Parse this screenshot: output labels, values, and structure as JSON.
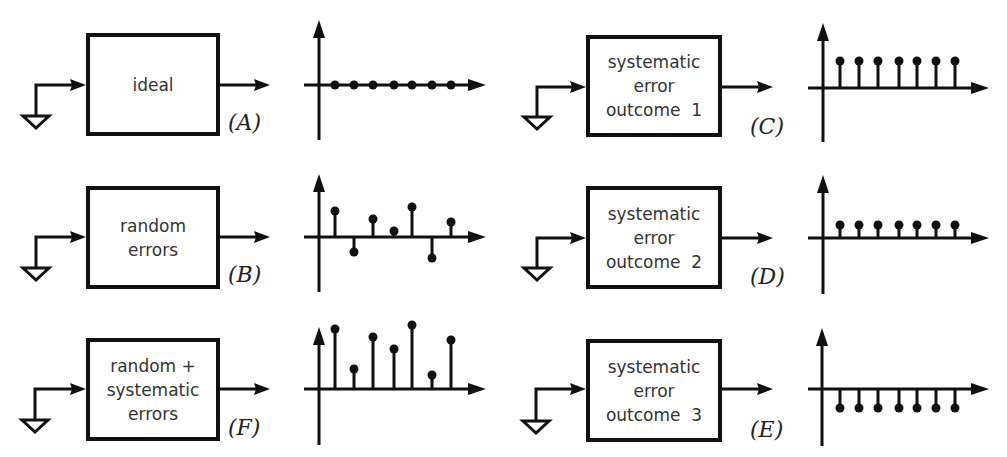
{
  "figure": {
    "colors": {
      "stroke": "#111111",
      "text": "#333333",
      "background": "#ffffff"
    }
  },
  "panels": [
    {
      "id": "A",
      "label": "(A)",
      "box_lines": [
        "ideal"
      ],
      "values": [
        0,
        0,
        0,
        0,
        0,
        0,
        0
      ]
    },
    {
      "id": "B",
      "label": "(B)",
      "box_lines": [
        "random",
        "errors"
      ],
      "values": [
        26,
        -15,
        18,
        6,
        30,
        -21,
        15
      ]
    },
    {
      "id": "F",
      "label": "(F)",
      "box_lines": [
        "random +",
        "systematic",
        "errors"
      ],
      "values": [
        60,
        20,
        52,
        40,
        64,
        14,
        49
      ]
    },
    {
      "id": "C",
      "label": "(C)",
      "box_lines": [
        "systematic",
        "error",
        "outcome  1"
      ],
      "values": [
        27,
        27,
        27,
        27,
        27,
        27,
        27
      ]
    },
    {
      "id": "D",
      "label": "(D)",
      "box_lines": [
        "systematic",
        "error",
        "outcome  2"
      ],
      "values": [
        13,
        13,
        13,
        13,
        13,
        13,
        13
      ]
    },
    {
      "id": "E",
      "label": "(E)",
      "box_lines": [
        "systematic",
        "error",
        "outcome  3"
      ],
      "values": [
        -19,
        -19,
        -19,
        -19,
        -19,
        -19,
        -19
      ]
    }
  ],
  "chart_data": [
    {
      "type": "stem",
      "title": "(A) ideal",
      "x": [
        1,
        2,
        3,
        4,
        5,
        6,
        7
      ],
      "values": [
        0,
        0,
        0,
        0,
        0,
        0,
        0
      ],
      "xlabel": "",
      "ylabel": "",
      "grid": false
    },
    {
      "type": "stem",
      "title": "(B) random errors",
      "x": [
        1,
        2,
        3,
        4,
        5,
        6,
        7
      ],
      "values": [
        26,
        -15,
        18,
        6,
        30,
        -21,
        15
      ],
      "xlabel": "",
      "ylabel": "",
      "grid": false
    },
    {
      "type": "stem",
      "title": "(F) random + systematic errors",
      "x": [
        1,
        2,
        3,
        4,
        5,
        6,
        7
      ],
      "values": [
        60,
        20,
        52,
        40,
        64,
        14,
        49
      ],
      "xlabel": "",
      "ylabel": "",
      "grid": false
    },
    {
      "type": "stem",
      "title": "(C) systematic error outcome 1",
      "x": [
        1,
        2,
        3,
        4,
        5,
        6,
        7
      ],
      "values": [
        27,
        27,
        27,
        27,
        27,
        27,
        27
      ],
      "xlabel": "",
      "ylabel": "",
      "grid": false
    },
    {
      "type": "stem",
      "title": "(D) systematic error outcome 2",
      "x": [
        1,
        2,
        3,
        4,
        5,
        6,
        7
      ],
      "values": [
        13,
        13,
        13,
        13,
        13,
        13,
        13
      ],
      "xlabel": "",
      "ylabel": "",
      "grid": false
    },
    {
      "type": "stem",
      "title": "(E) systematic error outcome 3",
      "x": [
        1,
        2,
        3,
        4,
        5,
        6,
        7
      ],
      "values": [
        -19,
        -19,
        -19,
        -19,
        -19,
        -19,
        -19
      ],
      "xlabel": "",
      "ylabel": "",
      "grid": false
    }
  ]
}
